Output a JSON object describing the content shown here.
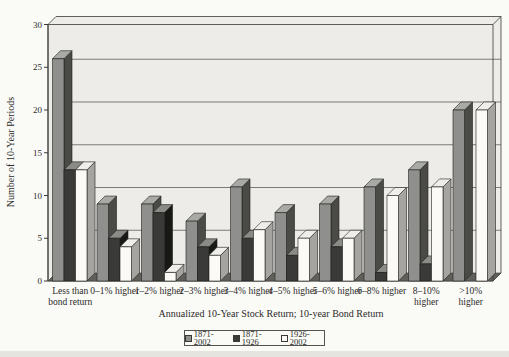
{
  "figure": {
    "background": "#fafaf7",
    "wall_color": "#edece8",
    "floor_color": "#605f5a",
    "grid_color": "#4a4a46",
    "frame_color": "#3a3a36",
    "text_color": "#2b2a28",
    "bottom_strip_color": "#e6e4df"
  },
  "chart_data": {
    "type": "bar",
    "style": "3d-clustered-column",
    "title": "",
    "xlabel": "Annualized 10-Year Stock Return; 10-year Bond Return",
    "ylabel": "Number of 10-Year Periods",
    "ylim": [
      0,
      30
    ],
    "yticks": [
      0,
      5,
      10,
      15,
      20,
      25,
      30
    ],
    "grid": true,
    "legend_position": "bottom",
    "categories": [
      "Less than\nbond return",
      "0–1% higher",
      "1–2% higher",
      "2–3% higher",
      "3–4% higher",
      "4–5% higher",
      "5–6% higher",
      "6–8% higher",
      "8–10%\nhigher",
      ">10%\nhigher"
    ],
    "series": [
      {
        "name": "1871-2002",
        "color": "#8f8f8d",
        "top_color": "#a9a9a5",
        "side_color": "#4a4a46",
        "values": [
          26,
          9,
          9,
          7,
          11,
          8,
          9,
          11,
          13,
          20
        ]
      },
      {
        "name": "1871-1926",
        "color": "#3a3a38",
        "top_color": "#8a8a86",
        "side_color": "#181816",
        "values": [
          13,
          5,
          8,
          4,
          5,
          3,
          4,
          1,
          2,
          0
        ]
      },
      {
        "name": "1926-2002",
        "color": "#fbfaf6",
        "top_color": "#efeeea",
        "side_color": "#a5a4a0",
        "values": [
          13,
          4,
          1,
          3,
          6,
          5,
          5,
          10,
          11,
          20
        ]
      }
    ]
  }
}
